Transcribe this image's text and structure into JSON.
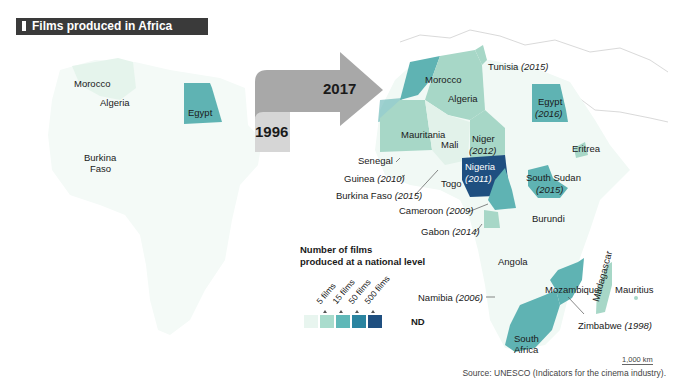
{
  "title": "Films produced in Africa (2017)",
  "arrow": {
    "from_year": "1996",
    "to_year": "2017"
  },
  "map_1996": {
    "labels": [
      "Morocco",
      "Algeria",
      "Egypt",
      "Burkina Faso"
    ],
    "label_burkina_line1": "Burkina",
    "label_burkina_line2": "Faso"
  },
  "map_2017": {
    "labels": {
      "tunisia": "Tunisia",
      "tunisia_year": "(2015)",
      "morocco": "Morocco",
      "algeria": "Algeria",
      "egypt": "Egypt",
      "egypt_year": "(2016)",
      "mauritania": "Mauritania",
      "mali": "Mali",
      "niger": "Niger",
      "niger_year": "(2012)",
      "senegal": "Senegal",
      "eritrea": "Eritrea",
      "guinea": "Guinea",
      "guinea_year": "(2010)",
      "togo": "Togo",
      "nigeria": "Nigeria",
      "nigeria_year": "(2011)",
      "south_sudan": "South Sudan",
      "south_sudan_year": "(2015)",
      "burkina": "Burkina Faso",
      "burkina_year": "(2015)",
      "cameroon": "Cameroon",
      "cameroon_year": "(2009)",
      "burundi": "Burundi",
      "gabon": "Gabon",
      "gabon_year": "(2014)",
      "angola": "Angola",
      "mozambique": "Mozambique",
      "madagascar": "Madagascar",
      "mauritius": "Mauritius",
      "namibia": "Namibia",
      "namibia_year": "(2006)",
      "zimbabwe": "Zimbabwe",
      "zimbabwe_year": "(1998)",
      "south_africa_1": "South",
      "south_africa_2": "Africa"
    }
  },
  "legend": {
    "title_line1": "Number of films",
    "title_line2": "produced at a national level",
    "ticks": [
      "5 films",
      "15 films",
      "50 films",
      "500 films"
    ],
    "nd_label": "ND",
    "colors": [
      "#e8f5ef",
      "#a9dccd",
      "#5fb8b8",
      "#2a84a0",
      "#1f4f80"
    ]
  },
  "scale": "1,000 km",
  "source": "Source: UNESCO (Indicators for the cinema industry).",
  "colors": {
    "title_bg": "#3a3a3a",
    "arrow_dark": "#a8a8a8",
    "arrow_light": "#d6d6d6",
    "continent_base": "#f2f9f6",
    "tier1": "#cfe9df",
    "tier2": "#a7d7c7",
    "tier3": "#5fb3b3",
    "tier4": "#1f4f80"
  }
}
